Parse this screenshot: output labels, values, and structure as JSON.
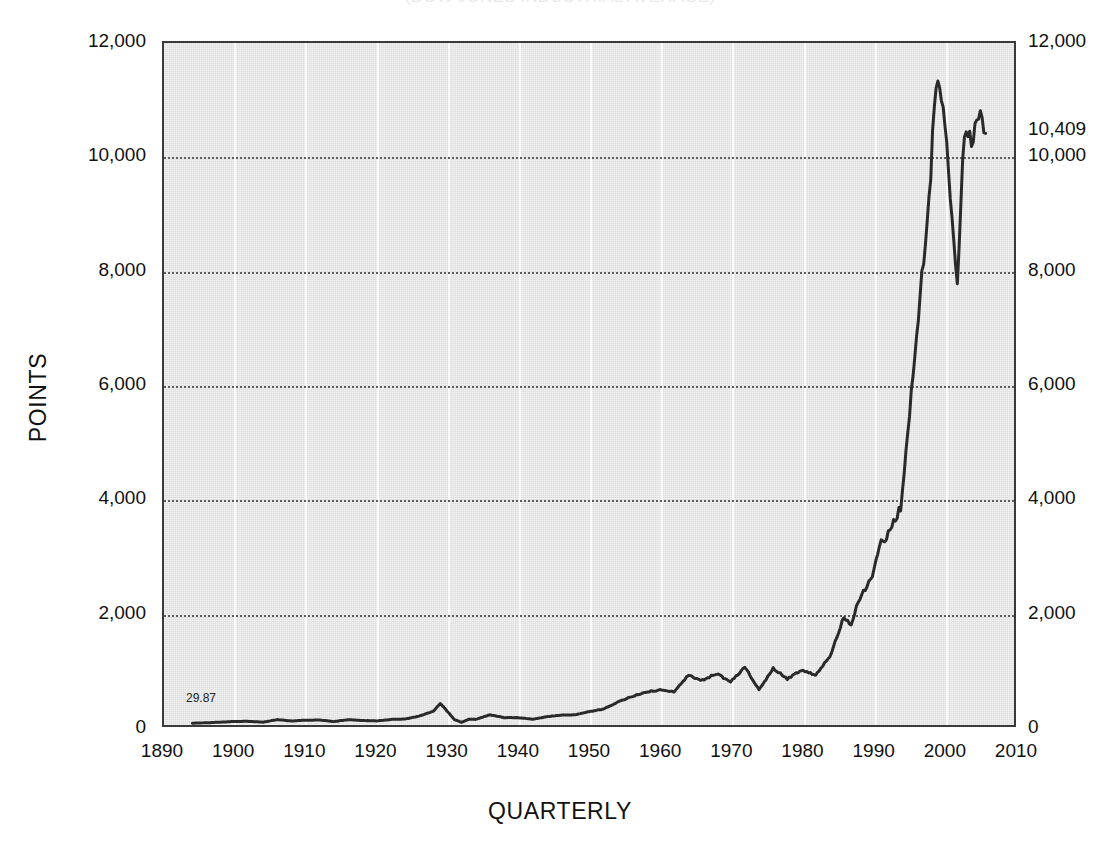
{
  "chart_data": {
    "type": "line",
    "title": "(DOW JONES INDUSTRIAL AVERAGE)",
    "xlabel": "QUARTERLY",
    "ylabel": "POINTS",
    "xlim": [
      1890,
      2010
    ],
    "ylim": [
      0,
      12000
    ],
    "grid": true,
    "legend": false,
    "legend_position": "none",
    "xticks": [
      "1890",
      "1900",
      "1910",
      "1920",
      "1930",
      "1940",
      "1950",
      "1960",
      "1970",
      "1980",
      "1990",
      "2000",
      "2010"
    ],
    "xtick_values": [
      1890,
      1900,
      1910,
      1920,
      1930,
      1940,
      1950,
      1960,
      1970,
      1980,
      1990,
      2000,
      2010
    ],
    "yticks_left": [
      "0",
      "2,000",
      "4,000",
      "6,000",
      "8,000",
      "10,000",
      "12,000"
    ],
    "yticks_right": [
      "0",
      "2,000",
      "4,000",
      "6,000",
      "8,000",
      "10,000",
      "12,000"
    ],
    "ytick_values": [
      0,
      2000,
      4000,
      6000,
      8000,
      10000,
      12000
    ],
    "annotations": [
      {
        "text": "29.87",
        "x": 1894,
        "y": 29.87,
        "placement": "in-plot-start"
      },
      {
        "text": "10,409",
        "x": 2010,
        "y": 10409,
        "placement": "right-axis-callout"
      }
    ],
    "series": [
      {
        "name": "Dow Jones Industrial Average",
        "color": "#2a2a2a",
        "x": [
          1894,
          1896,
          1898,
          1900,
          1902,
          1904,
          1906,
          1908,
          1910,
          1912,
          1914,
          1916,
          1918,
          1920,
          1922,
          1924,
          1926,
          1928,
          1929,
          1930,
          1931,
          1932,
          1933,
          1934,
          1936,
          1938,
          1940,
          1942,
          1944,
          1946,
          1948,
          1950,
          1952,
          1954,
          1956,
          1958,
          1960,
          1962,
          1964,
          1966,
          1968,
          1970,
          1972,
          1974,
          1976,
          1978,
          1980,
          1982,
          1984,
          1986,
          1987,
          1988,
          1990,
          1991,
          1992,
          1994,
          1996,
          1997,
          1998,
          1999,
          2000,
          2001,
          2002,
          2003,
          2004,
          2005,
          2006
        ],
        "y": [
          29.87,
          40,
          50,
          62,
          64,
          50,
          95,
          70,
          85,
          88,
          60,
          95,
          80,
          72,
          98,
          105,
          155,
          240,
          380,
          240,
          95,
          45,
          99,
          100,
          180,
          130,
          130,
          100,
          145,
          175,
          180,
          235,
          280,
          400,
          500,
          580,
          615,
          580,
          870,
          790,
          900,
          760,
          1020,
          620,
          1000,
          810,
          960,
          880,
          1210,
          1900,
          1740,
          2170,
          2630,
          3170,
          3300,
          3830,
          6450,
          7900,
          9180,
          11400,
          10800,
          9400,
          7750,
          10450,
          10350,
          10700,
          10409
        ],
        "key_points": [
          {
            "label": "start",
            "x": 1894,
            "y": 29.87
          },
          {
            "label": "1929 peak",
            "x": 1929,
            "y": 380
          },
          {
            "label": "1932 depression low",
            "x": 1932,
            "y": 45
          },
          {
            "label": "1987 crash",
            "x": 1987,
            "y": 1740
          },
          {
            "label": "2000 peak",
            "x": 2000,
            "y": 11400
          },
          {
            "label": "2002 low",
            "x": 2002,
            "y": 7750
          },
          {
            "label": "end",
            "x": 2006,
            "y": 10409
          }
        ]
      }
    ]
  },
  "colors": {
    "plot_background": "#e4e4e4",
    "page_background": "#ffffff",
    "frame": "#3a3a3a",
    "line": "#2a2a2a",
    "vertical_gridline": "#fbfbfb",
    "horizontal_gridline": "#5c5c5c",
    "text": "#111111"
  }
}
